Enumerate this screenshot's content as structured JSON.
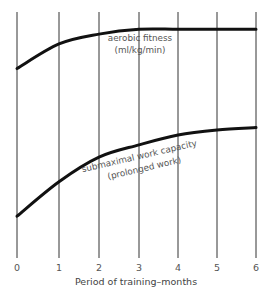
{
  "chart_data": {
    "type": "line",
    "title": "",
    "xlabel": "Period of training–months",
    "ylabel": "",
    "x": [
      0,
      1,
      2,
      3,
      4,
      5,
      6
    ],
    "x_tick_labels": [
      "0",
      "1",
      "2",
      "3",
      "4",
      "5",
      "6"
    ],
    "xlim": [
      0,
      6
    ],
    "ylim": [
      0,
      100
    ],
    "y_axis_shown": false,
    "y_units_note": "relative level (no y-axis scale shown)",
    "grid": {
      "vertical": true,
      "horizontal": false
    },
    "legend": "none (curves labeled inline)",
    "series": [
      {
        "name": "aerobic fitness",
        "label_line1": "aerobic fitness",
        "label_line2": "(ml/kg/min)",
        "values": [
          77,
          87,
          91,
          93,
          93,
          93,
          93
        ]
      },
      {
        "name": "submaximal work capacity",
        "label_line1": "submaximal work capacity",
        "label_line2": "(prolonged work)",
        "values": [
          17,
          31,
          41,
          46,
          50,
          52,
          53
        ]
      }
    ]
  },
  "plot": {
    "x_px": [
      17,
      59,
      99,
      139,
      178,
      217,
      256
    ],
    "y_top_px": 12,
    "y_bottom_px": 258
  }
}
